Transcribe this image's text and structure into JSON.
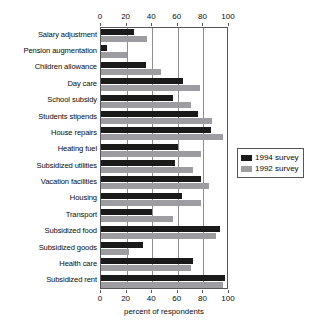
{
  "chart_data": {
    "type": "bar",
    "orientation": "horizontal",
    "title": "",
    "xlabel": "percent of respondents",
    "ylabel": "",
    "xlim": [
      0,
      100
    ],
    "xticks": [
      0,
      20,
      40,
      60,
      80,
      100
    ],
    "grid": true,
    "legend_position": "right",
    "categories": [
      "Salary adjustment",
      "Pension augmentation",
      "Children allowance",
      "Day care",
      "School subsidy",
      "Students stipends",
      "House repairs",
      "Heating fuel",
      "Subsidized utilities",
      "Vacation facilities",
      "Housing",
      "Transport",
      "Subsidized food",
      "Subsidized goods",
      "Health care",
      "Subsidized rent"
    ],
    "series": [
      {
        "name": "1994 survey",
        "color": "#1a1a1a",
        "values": [
          26,
          5,
          35,
          64,
          56,
          76,
          86,
          60,
          58,
          78,
          63,
          40,
          93,
          33,
          72,
          97
        ]
      },
      {
        "name": "1992 survey",
        "color": "#9d9da1",
        "values": [
          36,
          20,
          47,
          77,
          70,
          87,
          95,
          78,
          72,
          84,
          78,
          56,
          90,
          22,
          70,
          95
        ]
      }
    ]
  },
  "legend": {
    "entries": [
      {
        "label": "1994 survey"
      },
      {
        "label": "1992 survey"
      }
    ]
  },
  "axis": {
    "x_title": "percent of respondents"
  }
}
